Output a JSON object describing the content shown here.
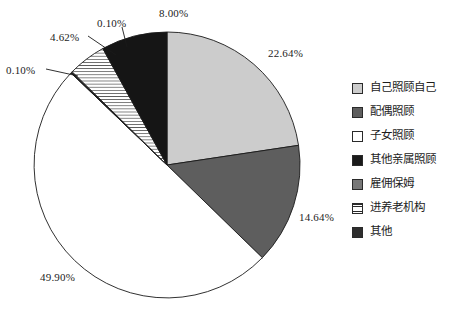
{
  "chart_data": {
    "type": "pie",
    "title": "",
    "subtitle": "",
    "xlabel": "",
    "ylabel": "",
    "grid": false,
    "legend_position": "right",
    "units": "percent",
    "start_angle_deg": 0,
    "direction": "clockwise",
    "categories": [
      "自己照顾自己",
      "配偶照顾",
      "子女照顾",
      "其他亲属照顾",
      "雇佣保姆",
      "进养老机构",
      "其他"
    ],
    "values": [
      22.64,
      14.64,
      49.9,
      0.1,
      0.1,
      4.62,
      8.0
    ],
    "labels": [
      "22.64%",
      "14.64%",
      "49.90%",
      "0.10%",
      "0.10%",
      "4.62%",
      "8.00%"
    ],
    "slices": [
      {
        "name": "自己照顾自己",
        "value": 22.64,
        "label": "22.64%",
        "fill": "#cccccc",
        "pattern": "solid",
        "start_deg": 0.0,
        "end_deg": 81.5
      },
      {
        "name": "配偶照顾",
        "value": 14.64,
        "label": "14.64%",
        "fill": "#5e5e5e",
        "pattern": "solid",
        "start_deg": 81.5,
        "end_deg": 134.2
      },
      {
        "name": "子女照顾",
        "value": 49.9,
        "label": "49.90%",
        "fill": "#ffffff",
        "pattern": "solid",
        "start_deg": 134.2,
        "end_deg": 313.8
      },
      {
        "name": "其他亲属照顾",
        "value": 0.1,
        "label": "0.10%",
        "fill": "#1a1a1a",
        "pattern": "solid",
        "start_deg": 313.8,
        "end_deg": 314.16
      },
      {
        "name": "雇佣保姆",
        "value": 0.1,
        "label": "0.10%",
        "fill": "#777777",
        "pattern": "solid",
        "start_deg": 314.16,
        "end_deg": 314.52
      },
      {
        "name": "进养老机构",
        "value": 4.62,
        "label": "4.62%",
        "fill": "#ffffff",
        "pattern": "horizontal-hatch",
        "start_deg": 314.52,
        "end_deg": 331.15
      },
      {
        "name": "其他",
        "value": 8.0,
        "label": "8.00%",
        "fill": "#151515",
        "pattern": "solid",
        "start_deg": 331.15,
        "end_deg": 360.0
      }
    ]
  },
  "value_labels": [
    {
      "text": "8.00%",
      "left": 159,
      "top": 8
    },
    {
      "text": "0.10%",
      "left": 97,
      "top": 18
    },
    {
      "text": "4.62%",
      "left": 50,
      "top": 32
    },
    {
      "text": "0.10%",
      "left": 6,
      "top": 65
    },
    {
      "text": "22.64%",
      "left": 268,
      "top": 48
    },
    {
      "text": "14.64%",
      "left": 299,
      "top": 212
    },
    {
      "text": "49.90%",
      "left": 40,
      "top": 272
    }
  ],
  "legend": {
    "items": [
      {
        "label": "自己照顾自己",
        "swatch": "light-gray",
        "color": "#cccccc"
      },
      {
        "label": "配偶照顾",
        "swatch": "dark-gray",
        "color": "#5e5e5e"
      },
      {
        "label": "子女照顾",
        "swatch": "white",
        "color": "#ffffff"
      },
      {
        "label": "其他亲属照顾",
        "swatch": "black",
        "color": "#1a1a1a"
      },
      {
        "label": "雇佣保姆",
        "swatch": "medium-gray",
        "color": "#777777"
      },
      {
        "label": "进养老机构",
        "swatch": "hatched",
        "color": "#ffffff"
      },
      {
        "label": "其他",
        "swatch": "near-black",
        "color": "#2e2e2e"
      }
    ]
  },
  "style": {
    "background": "#ffffff",
    "stroke": "#1a1a1a",
    "text": "#1c1c1c"
  }
}
